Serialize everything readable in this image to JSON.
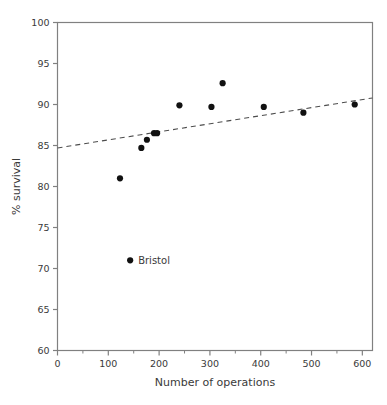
{
  "figure": {
    "background_color": "#ffffff",
    "axis_color": "#808080",
    "text_color": "#3a3a3a",
    "marker_color": "#111111",
    "trendline_color": "#4d4d4d"
  },
  "chart_data": {
    "type": "scatter",
    "title": "",
    "xlabel": "Number of operations",
    "ylabel": "% survival",
    "xlim": [
      0,
      620
    ],
    "ylim": [
      60,
      100
    ],
    "xticks": [
      0,
      100,
      200,
      300,
      400,
      500,
      600
    ],
    "xticklabels": [
      "0",
      "100",
      "200",
      "300",
      "400",
      "500",
      "600"
    ],
    "xminorticks": [
      50,
      150,
      250,
      350,
      450,
      550
    ],
    "yticks": [
      60,
      65,
      70,
      75,
      80,
      85,
      90,
      95,
      100
    ],
    "yticklabels": [
      "60",
      "65",
      "70",
      "75",
      "80",
      "85",
      "90",
      "95",
      "100"
    ],
    "grid": false,
    "legend": null,
    "points": [
      {
        "x": 123,
        "y": 81.0
      },
      {
        "x": 165,
        "y": 84.7
      },
      {
        "x": 176,
        "y": 85.7
      },
      {
        "x": 190,
        "y": 86.5
      },
      {
        "x": 196,
        "y": 86.5
      },
      {
        "x": 240,
        "y": 89.9
      },
      {
        "x": 303,
        "y": 89.7
      },
      {
        "x": 325,
        "y": 92.6
      },
      {
        "x": 406,
        "y": 89.7
      },
      {
        "x": 484,
        "y": 89.0
      },
      {
        "x": 585,
        "y": 90.0
      }
    ],
    "annotations": [
      {
        "label": "Bristol",
        "x": 143,
        "y": 71.0,
        "marker": true
      }
    ],
    "trendline": {
      "style": "dashed",
      "x0": 0,
      "y0": 84.7,
      "x1": 620,
      "y1": 90.8
    }
  }
}
